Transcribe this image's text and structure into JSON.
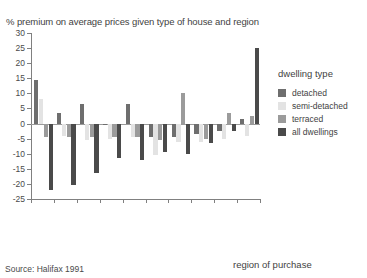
{
  "chart_data": {
    "type": "bar",
    "title": "% premium on average prices given type of house and region",
    "xlabel": "region of purchase",
    "ylabel": "",
    "ylim": [
      -25,
      30
    ],
    "yticks": [
      30,
      25,
      20,
      15,
      10,
      5,
      0,
      -5,
      -10,
      -15,
      -20,
      -25
    ],
    "grid": false,
    "legend_position": "right",
    "legend_title": "dwelling type",
    "categories": [
      "Northern",
      "Wales",
      "Yorkshire & Humberside",
      "North West",
      "East Midlands",
      "East Anglia",
      "Scotland",
      "West Midlands",
      "South West",
      "South East"
    ],
    "series": [
      {
        "name": "detached",
        "color": "#6e6e6e",
        "values": [
          14.5,
          3.5,
          6.5,
          0,
          6.5,
          -4.5,
          -4.5,
          -3.5,
          -2.5,
          1.5
        ]
      },
      {
        "name": "semi-detached",
        "color": "#e3e3e3",
        "values": [
          8,
          -4,
          -5.5,
          -5,
          -4.5,
          -10.5,
          -6,
          -6,
          -5,
          -4
        ]
      },
      {
        "name": "terraced",
        "color": "#9b9b9b",
        "values": [
          -4.5,
          -4.5,
          -4.5,
          -4.5,
          -4.5,
          -5.5,
          10,
          -5,
          3.5,
          2.5
        ]
      },
      {
        "name": "all dwellings",
        "color": "#4a4a4a",
        "values": [
          -22,
          -20.5,
          -16.5,
          -11.5,
          -12,
          -9.5,
          -10,
          -6.5,
          -2.5,
          25
        ]
      }
    ],
    "source": "Source: Halifax 1991"
  },
  "legend": {
    "title": "dwelling type",
    "items": [
      {
        "label": "detached",
        "color": "#6e6e6e"
      },
      {
        "label": "semi-detached",
        "color": "#e3e3e3"
      },
      {
        "label": "terraced",
        "color": "#9b9b9b"
      },
      {
        "label": "all dwellings",
        "color": "#4a4a4a"
      }
    ]
  },
  "labels": {
    "title": "% premium on average prices given type of house and region",
    "xaxis_title": "region of purchase",
    "source": "Source: Halifax 1991"
  }
}
